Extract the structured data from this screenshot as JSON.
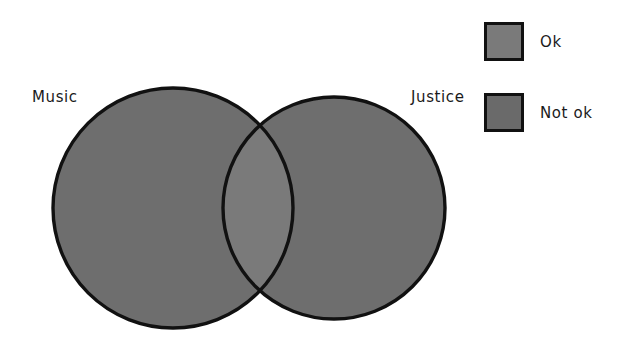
{
  "figure": {
    "type": "venn-diagram",
    "background_color": "#ffffff"
  },
  "chart_data": {
    "type": "venn",
    "title": "",
    "sets": [
      {
        "name": "Music",
        "label": "Music",
        "category": "Not ok",
        "fill_color": "#6e6e6e",
        "stroke_color": "#111111",
        "center_x": 173,
        "center_y": 208,
        "radius": 120
      },
      {
        "name": "Justice",
        "label": "Justice",
        "category": "Not ok",
        "fill_color": "#6e6e6e",
        "stroke_color": "#111111",
        "center_x": 334,
        "center_y": 208,
        "radius": 111
      }
    ],
    "intersection": {
      "label": "",
      "category": "Ok",
      "fill_color": "#7a7a7a"
    },
    "legend": {
      "position": "top-right",
      "entries": [
        {
          "label": "Ok",
          "color": "#7a7a7a",
          "border_color": "#111111"
        },
        {
          "label": "Not ok",
          "color": "#6a6a6a",
          "border_color": "#111111"
        }
      ]
    }
  },
  "labels": {
    "left_set": "Music",
    "right_set": "Justice"
  },
  "legend": {
    "items": [
      {
        "label": "Ok",
        "swatch_color": "#7a7a7a"
      },
      {
        "label": "Not ok",
        "swatch_color": "#6a6a6a"
      }
    ]
  }
}
